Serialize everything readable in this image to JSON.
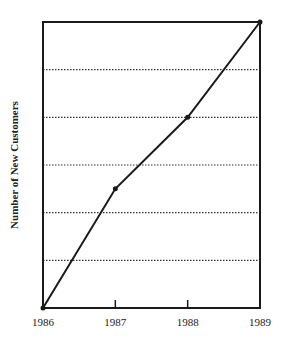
{
  "chart_data": {
    "type": "line",
    "title": "",
    "xlabel": "",
    "ylabel": "Number of New Customers",
    "categories": [
      "1986",
      "1987",
      "1988",
      "1989"
    ],
    "series": [
      {
        "name": "New Customers",
        "values": [
          0,
          2.5,
          4,
          6
        ]
      }
    ],
    "ylim": [
      0,
      6
    ],
    "y_gridlines": [
      1,
      2,
      3,
      4,
      5
    ],
    "y_tick_labels": [],
    "grid": "horizontal dotted",
    "legend": "none",
    "markers": true
  },
  "colors": {
    "line": "#1a1a1a",
    "frame": "#1a1a1a",
    "grid": "#333333",
    "background": "#ffffff"
  }
}
